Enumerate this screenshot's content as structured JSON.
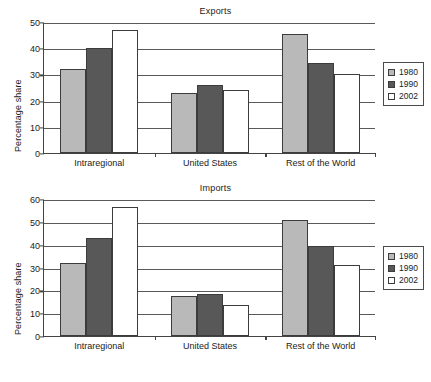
{
  "figure": {
    "ylabel": "Percentage share"
  },
  "legend": {
    "entries": [
      {
        "label": "1980",
        "color": "#b9b9b9"
      },
      {
        "label": "1990",
        "color": "#585858"
      },
      {
        "label": "2002",
        "color": "#ffffff"
      }
    ]
  },
  "chart_data": [
    {
      "type": "bar",
      "title": "Exports",
      "xlabel": "",
      "ylabel": "Percentage share",
      "ylim": [
        0,
        50
      ],
      "yticks": [
        0,
        10,
        20,
        30,
        40,
        50
      ],
      "grid": true,
      "legend_position": "right",
      "categories": [
        "Intraregional",
        "United States",
        "Rest of the World"
      ],
      "series": [
        {
          "name": "1980",
          "values": [
            32,
            23,
            45.5
          ]
        },
        {
          "name": "1990",
          "values": [
            40,
            26,
            34.5
          ]
        },
        {
          "name": "2002",
          "values": [
            47,
            24,
            30
          ]
        }
      ]
    },
    {
      "type": "bar",
      "title": "Imports",
      "xlabel": "",
      "ylabel": "Percentage share",
      "ylim": [
        0,
        60
      ],
      "yticks": [
        0,
        10,
        20,
        30,
        40,
        50,
        60
      ],
      "grid": true,
      "legend_position": "right",
      "categories": [
        "Intraregional",
        "United States",
        "Rest of the World"
      ],
      "series": [
        {
          "name": "1980",
          "values": [
            32,
            17.5,
            51
          ]
        },
        {
          "name": "1990",
          "values": [
            43,
            18.5,
            39.5
          ]
        },
        {
          "name": "2002",
          "values": [
            56.5,
            13.5,
            31
          ]
        }
      ]
    }
  ]
}
